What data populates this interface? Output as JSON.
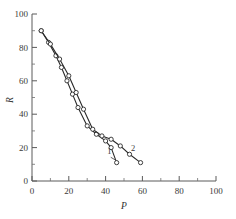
{
  "chart_data": {
    "type": "line",
    "title": "",
    "xlabel": "P",
    "ylabel": "R",
    "xlim": [
      0,
      100
    ],
    "ylim": [
      0,
      100
    ],
    "xticks": [
      0,
      20,
      40,
      60,
      80,
      100
    ],
    "yticks": [
      0,
      20,
      40,
      60,
      80,
      100
    ],
    "xtick_labels": [
      "0",
      "20",
      "40",
      "60",
      "80",
      "100"
    ],
    "ytick_labels": [
      "0",
      "20",
      "40",
      "60",
      "80",
      "100"
    ],
    "minor_tick_interval": 5,
    "grid": false,
    "legend_position": "inline-annotation",
    "marker": "open-circle",
    "series": [
      {
        "name": "1",
        "label": "1",
        "x": [
          5,
          9,
          13,
          16,
          19,
          22,
          25,
          30,
          35,
          40,
          43,
          46
        ],
        "y": [
          90,
          83,
          75,
          68,
          60,
          52,
          44,
          33,
          28,
          24,
          20,
          11
        ]
      },
      {
        "name": "2",
        "label": "2",
        "x": [
          5,
          10,
          15,
          20,
          24,
          28,
          33,
          38,
          43,
          48,
          53,
          59
        ],
        "y": [
          90,
          82,
          73,
          63,
          53,
          43,
          31,
          27,
          25,
          21,
          16,
          11
        ]
      }
    ],
    "annotations": [
      {
        "text": "1",
        "x": 42,
        "y": 16
      },
      {
        "text": "2",
        "x": 55,
        "y": 18
      }
    ]
  },
  "axis": {
    "x_title": "P",
    "y_title": "R"
  }
}
